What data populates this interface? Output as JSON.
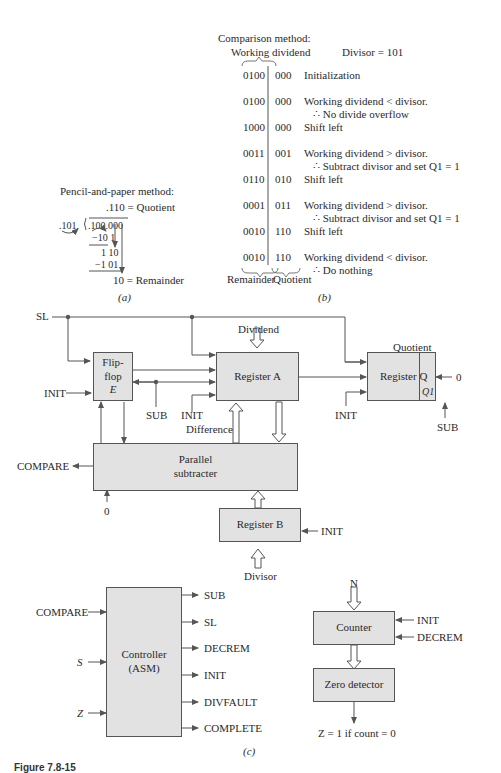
{
  "part_a": {
    "title": "Pencil-and-paper method:",
    "quotient_line": ".110  = Quotient",
    "divisor": ".101.",
    "dividend": ".100.000",
    "step1": "−10 1",
    "partial": "1 10",
    "step2": "−1 01",
    "remainder_line": "10  =  Remainder",
    "label": "(a)"
  },
  "part_b": {
    "title": "Comparison method:",
    "col_working_dividend": "Working dividend",
    "divisor_note": "Divisor = 101",
    "rows": [
      {
        "dividend": "0100",
        "quotient": "000",
        "note": "Initialization",
        "note2": ""
      },
      {
        "dividend": "0100",
        "quotient": "000",
        "note": "Working dividend < divisor.",
        "note2": "∴  No divide overflow"
      },
      {
        "dividend": "1000",
        "quotient": "000",
        "note": "Shift left",
        "note2": ""
      },
      {
        "dividend": "0011",
        "quotient": "001",
        "note": "Working dividend > divisor.",
        "note2": "∴  Subtract divisor and set Q1 = 1"
      },
      {
        "dividend": "0110",
        "quotient": "010",
        "note": "Shift left",
        "note2": ""
      },
      {
        "dividend": "0001",
        "quotient": "011",
        "note": "Working dividend > divisor.",
        "note2": "∴  Subtract divisor and set Q1 = 1"
      },
      {
        "dividend": "0010",
        "quotient": "110",
        "note": "Shift left",
        "note2": ""
      },
      {
        "dividend": "0010",
        "quotient": "110",
        "note": "Working dividend < divisor.",
        "note2": "∴  Do nothing"
      }
    ],
    "foot_remainder": "Remainder",
    "foot_quotient": "Quotient",
    "label": "(b)"
  },
  "part_c": {
    "signals": {
      "sl": "SL",
      "init": "INIT",
      "sub": "SUB",
      "compare": "COMPARE",
      "zero": "0",
      "dividend": "Dividend",
      "difference": "Difference",
      "divisor": "Divisor",
      "quotient": "Quotient",
      "s": "S",
      "z": "Z",
      "n": "N",
      "decrem": "DECREM",
      "z_note": "Z = 1 if count = 0"
    },
    "blocks": {
      "flipflop": [
        "Flip-",
        "flop",
        "E"
      ],
      "register_a": "Register A",
      "register_q": "Register Q",
      "q1": "Q1",
      "subtracter": [
        "Parallel",
        "subtracter"
      ],
      "register_b": "Register B",
      "controller": [
        "Controller",
        "(ASM)"
      ],
      "counter": "Counter",
      "zero_detector": "Zero detector"
    },
    "controller_outputs": [
      "SUB",
      "SL",
      "DECREM",
      "INIT",
      "DIVFAULT",
      "COMPLETE"
    ],
    "label": "(c)"
  },
  "caption": "Figure 7.8-15",
  "colors": {
    "box_fill": "#e2e2e2",
    "line": "#555555"
  }
}
